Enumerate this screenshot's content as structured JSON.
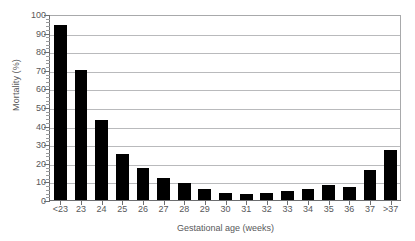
{
  "chart_data": {
    "type": "bar",
    "title": "",
    "xlabel": "Gestational age (weeks)",
    "ylabel": "Mortality (%)",
    "categories": [
      "<23",
      "23",
      "24",
      "25",
      "26",
      "27",
      "28",
      "29",
      "30",
      "31",
      "32",
      "33",
      "34",
      "35",
      "36",
      "37",
      ">37"
    ],
    "values": [
      94,
      70,
      43,
      25,
      17,
      12,
      9,
      6,
      4,
      3,
      4,
      5,
      6,
      8,
      7,
      16,
      27
    ],
    "ylim": [
      0,
      100
    ],
    "y_ticks": [
      0,
      10,
      20,
      30,
      40,
      50,
      60,
      70,
      80,
      90,
      100
    ],
    "y_tick_labels": [
      "0",
      "10",
      "20",
      "30",
      "40",
      "50",
      "60",
      "70",
      "80",
      "90",
      "100"
    ],
    "y_minor_tick_step": 2,
    "grid": "horizontal",
    "legend": "none",
    "bar_color": "#000000",
    "grid_color": "#b9babc",
    "axis_color": "#6d6e70",
    "text_color": "#58585a",
    "background": "#ffffff"
  }
}
